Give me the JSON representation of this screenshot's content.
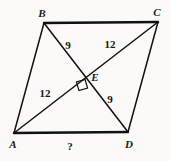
{
  "figure": {
    "type": "geometry-diagram",
    "shape": "parallelogram",
    "background_color": "#fbfaf9",
    "stroke_color": "#111111",
    "width": 171,
    "height": 161
  },
  "vertices": [
    {
      "name": "B",
      "label": "B",
      "x": 44,
      "y": 23,
      "label_x": 42,
      "label_y": 13
    },
    {
      "name": "C",
      "label": "C",
      "x": 158,
      "y": 22,
      "label_x": 157,
      "label_y": 12
    },
    {
      "name": "A",
      "label": "A",
      "x": 14,
      "y": 133,
      "label_x": 13,
      "label_y": 144
    },
    {
      "name": "D",
      "label": "D",
      "x": 128,
      "y": 132,
      "label_x": 129,
      "label_y": 144
    },
    {
      "name": "E",
      "label": "E",
      "x": 85,
      "y": 78,
      "label_x": 95,
      "label_y": 77
    }
  ],
  "sides": [
    {
      "name": "BC",
      "from": "B",
      "to": "C",
      "weight": 2.2
    },
    {
      "name": "CD",
      "from": "C",
      "to": "D",
      "weight": 1.4
    },
    {
      "name": "AD",
      "from": "A",
      "to": "D",
      "weight": 2.2
    },
    {
      "name": "AB",
      "from": "A",
      "to": "B",
      "weight": 1.4
    }
  ],
  "diagonals": [
    {
      "name": "BD",
      "from": "B",
      "to": "D",
      "weight": 1.4
    },
    {
      "name": "AC",
      "from": "A",
      "to": "C",
      "weight": 1.4
    }
  ],
  "right_angle": {
    "name": "right-angle-at-E",
    "x": 82,
    "y": 85,
    "size": 9,
    "rotation": -16
  },
  "measurements": [
    {
      "name": "segment-BE",
      "segment": "BE",
      "value": "9",
      "x": 68,
      "y": 45
    },
    {
      "name": "segment-EC",
      "segment": "EC",
      "value": "12",
      "x": 110,
      "y": 44
    },
    {
      "name": "segment-AE",
      "segment": "AE",
      "value": "12",
      "x": 45,
      "y": 93
    },
    {
      "name": "segment-ED",
      "segment": "ED",
      "value": "9",
      "x": 110,
      "y": 99
    }
  ],
  "unknown": {
    "name": "side-AD-unknown",
    "value": "?",
    "x": 70,
    "y": 146
  }
}
